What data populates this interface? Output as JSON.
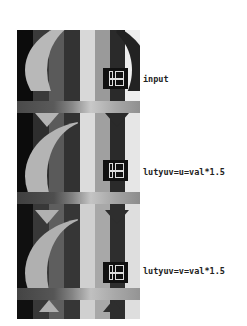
{
  "panels": [
    {
      "label": "input",
      "stripe_colors": [
        "#0c0c0c",
        "#3a3a3a",
        "#5a5a5a",
        "#333333",
        "#d8d8d8",
        "#9a9a9a",
        "#2a2a2a",
        "#eeeeee"
      ],
      "circle_color": "#b8b8b8",
      "bar_colors": [
        "#4a4a4a",
        "#5a5a5a",
        "#888888",
        "#c8c8c8",
        "#a8a8a8",
        "#909090"
      ],
      "digit_text": "10"
    },
    {
      "label": "lutyuv=u=val*1.5",
      "stripe_colors": [
        "#0c0c0c",
        "#2e2e2e",
        "#5a5a5a",
        "#323232",
        "#dcdcdc",
        "#a0a0a0",
        "#2a2a2a",
        "#e6e6e6"
      ],
      "circle_color": "#b4b4b4",
      "bar_colors": [
        "#404040",
        "#4e4e4e",
        "#808080",
        "#c4c4c4",
        "#a4a4a4",
        "#8c8c8c"
      ],
      "digit_text": "10"
    },
    {
      "label": "lutyuv=v=val*1.5",
      "stripe_colors": [
        "#101010",
        "#383838",
        "#5e5e5e",
        "#363636",
        "#d0d0d0",
        "#a8a8a8",
        "#2e2e2e",
        "#dedede"
      ],
      "circle_color": "#b0b0b0",
      "bar_colors": [
        "#444444",
        "#565656",
        "#848484",
        "#c0c0c0",
        "#a8a8a8",
        "#949494"
      ],
      "digit_text": "10"
    }
  ]
}
